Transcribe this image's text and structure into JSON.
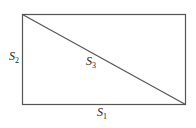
{
  "diagram": {
    "shape": "rectangle-with-diagonal",
    "rect": {
      "x": 22,
      "y": 14,
      "width": 163,
      "height": 90
    },
    "diagonal": {
      "from": "top-left",
      "to": "bottom-right"
    },
    "stroke_color": "#555555",
    "labels": {
      "bottom": {
        "base": "S",
        "sub": "1"
      },
      "left": {
        "base": "S",
        "sub": "2"
      },
      "diagonal": {
        "base": "S",
        "sub": "3"
      }
    }
  }
}
